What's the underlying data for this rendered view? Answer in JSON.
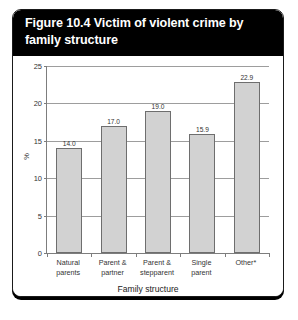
{
  "figure": {
    "title": "Figure 10.4 Victim of violent crime by family structure"
  },
  "chart_data": {
    "type": "bar",
    "title": "Figure 10.4 Victim of violent crime by family structure",
    "categories": [
      "Natural parents",
      "Parent & partner",
      "Parent & stepparent",
      "Single parent",
      "Other*"
    ],
    "category_lines": [
      [
        "Natural",
        "parents"
      ],
      [
        "Parent &",
        "partner"
      ],
      [
        "Parent &",
        "stepparent"
      ],
      [
        "Single",
        "parent"
      ],
      [
        "Other*",
        ""
      ]
    ],
    "values": [
      14.0,
      17.0,
      19.0,
      15.9,
      22.9
    ],
    "value_labels": [
      "14.0",
      "17.0",
      "19.0",
      "15.9",
      "22.9"
    ],
    "xlabel": "Family structure",
    "ylabel": "%",
    "ylim": [
      0,
      25
    ],
    "yticks": [
      0,
      5,
      10,
      15,
      20,
      25
    ],
    "ytick_labels": [
      "0",
      "5",
      "10",
      "15",
      "20",
      "25"
    ],
    "grid": true,
    "legend": false,
    "bar_color": "#d2d2d2",
    "bar_border_color": "#6e6e6e",
    "title_background": "#000000",
    "title_color": "#ffffff"
  }
}
